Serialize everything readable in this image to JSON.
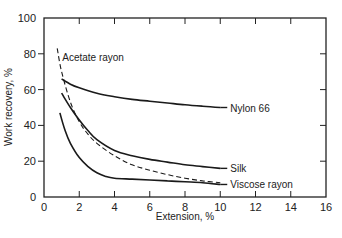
{
  "chart_data": {
    "type": "line",
    "title": "",
    "xlabel": "Extension, %",
    "ylabel": "Work recovery, %",
    "xlim": [
      0,
      16
    ],
    "ylim": [
      0,
      100
    ],
    "xticks": [
      0,
      2,
      4,
      6,
      8,
      10,
      12,
      14,
      16
    ],
    "yticks": [
      0,
      20,
      40,
      60,
      80,
      100
    ],
    "grid": false,
    "legend": "direct curve labels",
    "series": [
      {
        "name": "Nylon 66",
        "style": "solid",
        "x": [
          1.0,
          1.5,
          2,
          3,
          4,
          5,
          6,
          7,
          8,
          9,
          10
        ],
        "y": [
          66,
          63,
          61,
          58,
          56,
          54.5,
          53.5,
          52.5,
          51.5,
          50.7,
          50
        ]
      },
      {
        "name": "Silk",
        "style": "solid",
        "x": [
          1.0,
          1.5,
          2,
          2.5,
          3,
          4,
          5,
          6,
          7,
          8,
          9,
          10
        ],
        "y": [
          58,
          50,
          43,
          37,
          32,
          26,
          23,
          21,
          19.5,
          18,
          17,
          16
        ]
      },
      {
        "name": "Viscose rayon",
        "style": "solid",
        "x": [
          0.9,
          1.2,
          1.5,
          2,
          2.5,
          3,
          3.5,
          4,
          5,
          6,
          7,
          8,
          9,
          10
        ],
        "y": [
          47,
          37,
          30,
          22,
          17,
          13.5,
          11.5,
          10.5,
          10,
          9.5,
          9,
          8.5,
          8,
          7
        ]
      },
      {
        "name": "Acetate rayon",
        "style": "dashed",
        "x": [
          0.75,
          1,
          1.5,
          2,
          2.5,
          3,
          4,
          5,
          6,
          7,
          8,
          9,
          10
        ],
        "y": [
          83,
          70,
          53,
          42,
          35,
          30,
          23,
          18,
          15,
          12.5,
          10.5,
          9,
          8
        ]
      }
    ]
  }
}
